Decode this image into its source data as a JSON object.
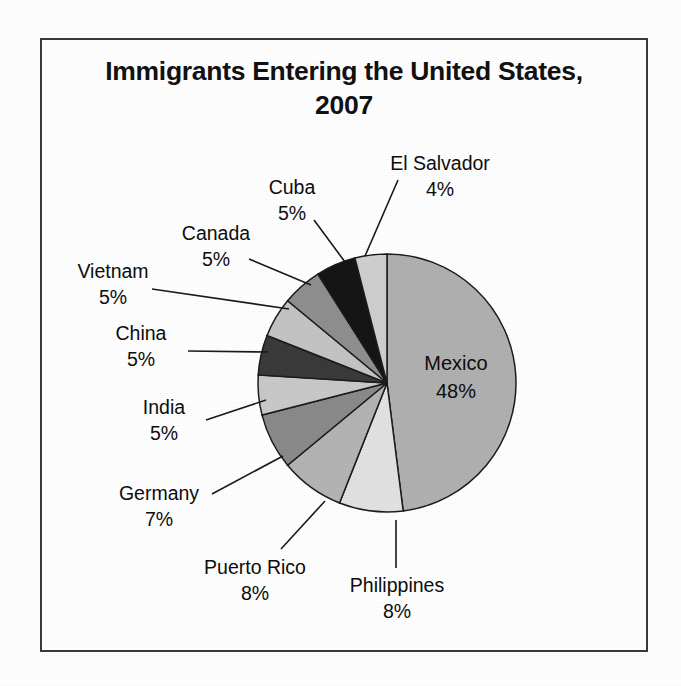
{
  "chart_data": {
    "type": "pie",
    "title": "Immigrants Entering the United States, 2007",
    "title_line1": "Immigrants Entering the United States,",
    "title_line2": "2007",
    "xlabel": "",
    "ylabel": "",
    "legend": "none",
    "grid": false,
    "units": "percent",
    "start_angle_deg": 0,
    "direction": "clockwise",
    "categories": [
      "Mexico",
      "Philippines",
      "Puerto Rico",
      "Germany",
      "India",
      "China",
      "Vietnam",
      "Canada",
      "Cuba",
      "El Salvador"
    ],
    "values": [
      48,
      8,
      8,
      7,
      5,
      5,
      5,
      5,
      5,
      4
    ],
    "slices": [
      {
        "label": "Mexico",
        "value": 48,
        "value_text": "48%",
        "color": "#b0b0b0",
        "label_placement": "inside"
      },
      {
        "label": "Philippines",
        "value": 8,
        "value_text": "8%",
        "color": "#e2e2e2",
        "label_placement": "outside"
      },
      {
        "label": "Puerto Rico",
        "value": 8,
        "value_text": "8%",
        "color": "#b4b4b4",
        "label_placement": "outside"
      },
      {
        "label": "Germany",
        "value": 7,
        "value_text": "7%",
        "color": "#8a8a8a",
        "label_placement": "outside"
      },
      {
        "label": "India",
        "value": 5,
        "value_text": "5%",
        "color": "#c9c9c9",
        "label_placement": "outside"
      },
      {
        "label": "China",
        "value": 5,
        "value_text": "5%",
        "color": "#3a3a3a",
        "label_placement": "outside"
      },
      {
        "label": "Vietnam",
        "value": 5,
        "value_text": "5%",
        "color": "#c4c4c4",
        "label_placement": "outside"
      },
      {
        "label": "Canada",
        "value": 5,
        "value_text": "5%",
        "color": "#8f8f8f",
        "label_placement": "outside"
      },
      {
        "label": "Cuba",
        "value": 5,
        "value_text": "5%",
        "color": "#151515",
        "label_placement": "outside"
      },
      {
        "label": "El Salvador",
        "value": 4,
        "value_text": "4%",
        "color": "#cfcfcf",
        "label_placement": "outside"
      }
    ]
  },
  "labels": {
    "mexico_name": "Mexico",
    "mexico_pct": "48%",
    "philippines_name": "Philippines",
    "philippines_pct": "8%",
    "puerto_rico_name": "Puerto Rico",
    "puerto_rico_pct": "8%",
    "germany_name": "Germany",
    "germany_pct": "7%",
    "india_name": "India",
    "india_pct": "5%",
    "china_name": "China",
    "china_pct": "5%",
    "vietnam_name": "Vietnam",
    "vietnam_pct": "5%",
    "canada_name": "Canada",
    "canada_pct": "5%",
    "cuba_name": "Cuba",
    "cuba_pct": "5%",
    "el_salvador_name": "El Salvador",
    "el_salvador_pct": "4%"
  }
}
